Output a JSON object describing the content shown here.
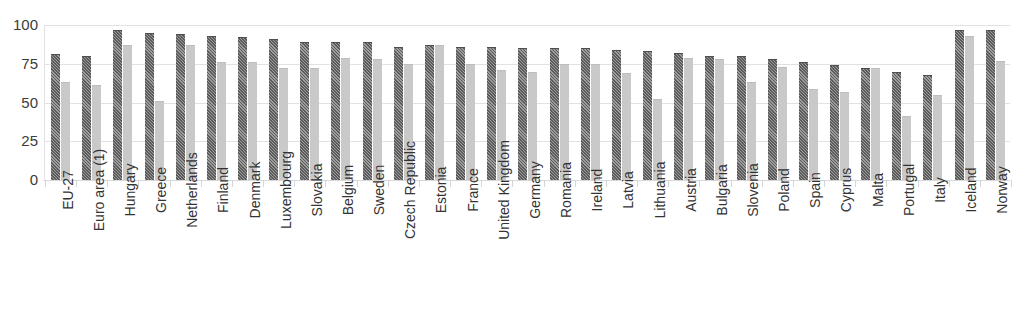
{
  "chart_data": {
    "type": "bar",
    "title": "",
    "xlabel": "",
    "ylabel": "",
    "ylim": [
      0,
      100
    ],
    "yticks": [
      100,
      75,
      50,
      25,
      0
    ],
    "grid": "horizontal",
    "legend_position": "bottom (cropped)",
    "orientation": "vertical-grouped",
    "categories": [
      "EU-27",
      "Euro area (1)",
      "Hungary",
      "Greece",
      "Netherlands",
      "Finland",
      "Denmark",
      "Luxembourg",
      "Slovakia",
      "Belgium",
      "Sweden",
      "Czech Republic",
      "Estonia",
      "France",
      "United Kingdom",
      "Germany",
      "Romania",
      "Ireland",
      "Latvia",
      "Lithuania",
      "Austria",
      "Bulgaria",
      "Slovenia",
      "Poland",
      "Spain",
      "Cyprus",
      "Malta",
      "Portugal",
      "Italy",
      "Iceland",
      "Norway"
    ],
    "series": [
      {
        "name": "series-1-dark-hatched",
        "values": [
          81,
          80,
          97,
          95,
          94,
          93,
          92,
          91,
          89,
          89,
          89,
          86,
          87,
          86,
          86,
          85,
          85,
          85,
          84,
          83,
          82,
          80,
          80,
          78,
          76,
          74,
          72,
          70,
          68,
          97,
          97
        ]
      },
      {
        "name": "series-2-light-solid",
        "values": [
          63,
          61,
          87,
          51,
          87,
          76,
          76,
          72,
          72,
          79,
          78,
          75,
          87,
          75,
          71,
          70,
          75,
          75,
          69,
          52,
          79,
          78,
          63,
          73,
          59,
          57,
          72,
          41,
          55,
          93,
          77
        ]
      }
    ]
  },
  "fragments": {
    "top_clipped_text": "",
    "bottom_clipped_caption": ""
  },
  "colors": {
    "series1": "#6f6f6f",
    "series2": "#c9c9c9",
    "gridline": "#e2e2e2",
    "tick_text": "#3c3c3c",
    "label_text": "#333333"
  }
}
